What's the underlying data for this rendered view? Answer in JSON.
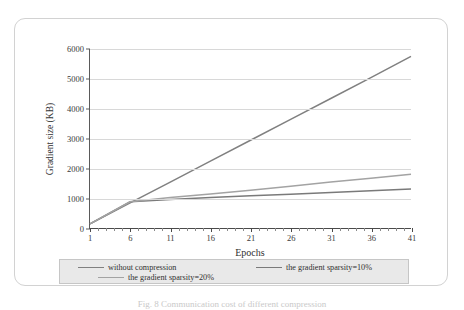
{
  "figure": {
    "caption": "Fig. 8   Communication cost of different compression"
  },
  "chart_data": {
    "type": "line",
    "title": "Communication cost",
    "xlabel": "Epochs",
    "ylabel": "Gradient size (KB)",
    "xlim": [
      1,
      41
    ],
    "ylim": [
      0,
      6000
    ],
    "grid": "horizontal",
    "legend_position": "bottom",
    "xticks": [
      1,
      6,
      11,
      16,
      21,
      26,
      31,
      36,
      41
    ],
    "yticks": [
      0,
      1000,
      2000,
      3000,
      4000,
      5000,
      6000
    ],
    "x": [
      1,
      6,
      11,
      16,
      21,
      26,
      31,
      36,
      41
    ],
    "series": [
      {
        "name": "without compression",
        "color": "#808080",
        "values": [
          140,
          840,
          1540,
          2240,
          2940,
          3640,
          4340,
          5040,
          5750
        ]
      },
      {
        "name": "the gradient sparsity=10%",
        "color": "#7a7a7a",
        "values": [
          140,
          880,
          955,
          1020,
          1080,
          1130,
          1190,
          1250,
          1310
        ]
      },
      {
        "name": "the gradient sparsity=20%",
        "color": "#a3a3a3",
        "values": [
          140,
          880,
          1020,
          1140,
          1265,
          1400,
          1540,
          1670,
          1800
        ]
      }
    ]
  }
}
